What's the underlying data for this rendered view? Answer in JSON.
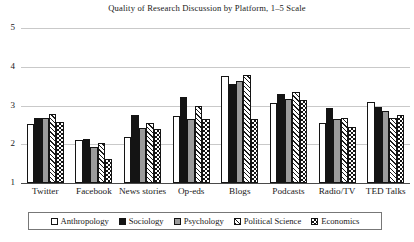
{
  "chart_data": {
    "type": "bar",
    "title": "Quality of Research Discussion by Platform, 1–5 Scale",
    "xlabel": "",
    "ylabel": "",
    "ylim": [
      1,
      5
    ],
    "yticks": [
      1,
      2,
      3,
      4,
      5
    ],
    "grid": true,
    "legend_position": "bottom",
    "categories": [
      "Twitter",
      "Facebook",
      "News stories",
      "Op-eds",
      "Blogs",
      "Podcasts",
      "Radio/TV",
      "TED Talks"
    ],
    "series": [
      {
        "name": "Anthropology",
        "pattern": "open-white",
        "color": "#ffffff",
        "values": [
          2.52,
          2.1,
          2.19,
          2.73,
          3.76,
          3.07,
          2.54,
          3.09
        ]
      },
      {
        "name": "Sociology",
        "pattern": "solid-black",
        "color": "#141414",
        "values": [
          2.68,
          2.13,
          2.76,
          3.23,
          3.56,
          3.31,
          2.93,
          2.97
        ]
      },
      {
        "name": "Psychology",
        "pattern": "solid-gray",
        "color": "#9b9b9b",
        "values": [
          2.67,
          1.92,
          2.43,
          2.65,
          3.64,
          3.18,
          2.66,
          2.87
        ]
      },
      {
        "name": "Political Science",
        "pattern": "diagonal-hatch",
        "color": "#ffffff",
        "values": [
          2.79,
          2.03,
          2.56,
          2.98,
          3.78,
          3.35,
          2.67,
          2.67
        ]
      },
      {
        "name": "Economics",
        "pattern": "checkerboard",
        "color": "#ffffff",
        "values": [
          2.58,
          1.63,
          2.4,
          2.65,
          2.64,
          3.15,
          2.45,
          2.76
        ]
      }
    ]
  }
}
